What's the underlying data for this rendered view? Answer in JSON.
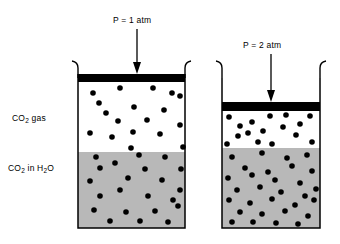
{
  "figure": {
    "title": "",
    "background": "#ffffff",
    "width": 340,
    "height": 244
  },
  "colors": {
    "outline": "#000000",
    "piston": "#000000",
    "liquid_fill": "#b8b8b8",
    "gas_fill": "#ffffff",
    "molecule": "#000000",
    "arrow": "#000000"
  },
  "labels": {
    "left_pressure": "P = 1 atm",
    "right_pressure": "P = 2 atm",
    "gas_phase": "CO2 gas",
    "gas_phase_html": "CO<sub>2</sub> gas",
    "aqueous_phase": "CO2 in H2O",
    "aqueous_phase_html": "CO<sub>2</sub> in H<sub>2</sub>O"
  },
  "chart_data": {
    "type": "diagram",
    "panels": [
      {
        "id": "left",
        "pressure_label": "P = 1 atm",
        "pressure_atm": 1,
        "container": {
          "x": 78,
          "y_top": 74,
          "y_bottom": 228,
          "width": 107
        },
        "piston_y": 74,
        "piston_thickness": 8,
        "liquid_level_y": 152,
        "gas_molecule_count": 18,
        "dissolved_molecule_count": 22,
        "gas_molecules": [
          [
            93,
            93
          ],
          [
            120,
            88
          ],
          [
            153,
            88
          ],
          [
            180,
            96
          ],
          [
            106,
            113
          ],
          [
            134,
            107
          ],
          [
            164,
            110
          ],
          [
            90,
            133
          ],
          [
            112,
            137
          ],
          [
            133,
            132
          ],
          [
            160,
            134
          ],
          [
            180,
            125
          ],
          [
            131,
            148
          ],
          [
            185,
            147
          ],
          [
            99,
            103
          ],
          [
            147,
            120
          ],
          [
            172,
            93
          ],
          [
            118,
            121
          ]
        ],
        "dissolved_molecules": [
          [
            96,
            157
          ],
          [
            139,
            155
          ],
          [
            165,
            157
          ],
          [
            115,
            163
          ],
          [
            145,
            169
          ],
          [
            186,
            169
          ],
          [
            90,
            181
          ],
          [
            128,
            178
          ],
          [
            162,
            180
          ],
          [
            182,
            190
          ],
          [
            100,
            196
          ],
          [
            120,
            190
          ],
          [
            148,
            196
          ],
          [
            173,
            200
          ],
          [
            94,
            210
          ],
          [
            126,
            212
          ],
          [
            155,
            211
          ],
          [
            182,
            206
          ],
          [
            110,
            221
          ],
          [
            140,
            221
          ],
          [
            168,
            222
          ],
          [
            100,
            168
          ]
        ]
      },
      {
        "id": "right",
        "pressure_label": "P = 2 atm",
        "pressure_atm": 2,
        "container": {
          "x": 222,
          "y_top": 102,
          "y_bottom": 228,
          "width": 98
        },
        "piston_y": 102,
        "piston_thickness": 9,
        "liquid_level_y": 148,
        "gas_molecule_count": 16,
        "dissolved_molecule_count": 30,
        "gas_molecules": [
          [
            229,
            116
          ],
          [
            252,
            122
          ],
          [
            270,
            114
          ],
          [
            285,
            113
          ],
          [
            310,
            114
          ],
          [
            240,
            125
          ],
          [
            263,
            131
          ],
          [
            283,
            127
          ],
          [
            300,
            123
          ],
          [
            238,
            136
          ],
          [
            258,
            142
          ],
          [
            272,
            145
          ],
          [
            296,
            134
          ],
          [
            313,
            142
          ],
          [
            227,
            145
          ],
          [
            248,
            133
          ]
        ],
        "dissolved_molecules": [
          [
            232,
            157
          ],
          [
            262,
            153
          ],
          [
            287,
            158
          ],
          [
            307,
            155
          ],
          [
            245,
            168
          ],
          [
            268,
            172
          ],
          [
            292,
            166
          ],
          [
            312,
            171
          ],
          [
            228,
            178
          ],
          [
            252,
            175
          ],
          [
            275,
            180
          ],
          [
            300,
            183
          ],
          [
            237,
            190
          ],
          [
            260,
            187
          ],
          [
            281,
            192
          ],
          [
            305,
            196
          ],
          [
            229,
            200
          ],
          [
            250,
            203
          ],
          [
            272,
            199
          ],
          [
            295,
            205
          ],
          [
            314,
            200
          ],
          [
            240,
            212
          ],
          [
            262,
            214
          ],
          [
            285,
            211
          ],
          [
            308,
            216
          ],
          [
            232,
            222
          ],
          [
            253,
            222
          ],
          [
            276,
            223
          ],
          [
            298,
            224
          ],
          [
            318,
            189
          ]
        ]
      }
    ],
    "annotation": "Higher applied pressure compresses the gas phase and increases the amount of CO2 dissolved in the water."
  }
}
